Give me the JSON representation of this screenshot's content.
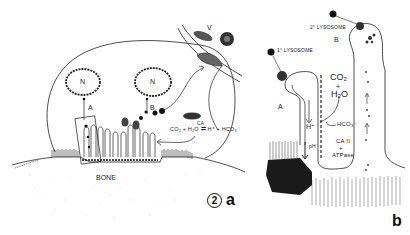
{
  "figure": {
    "number": "2",
    "panels": [
      {
        "id": "a",
        "label": "a",
        "labels": {
          "nucleus_left": "N",
          "nucleus_right": "N",
          "pathway_a": "A",
          "pathway_b": "B",
          "vessel": "V",
          "bone": "BONE",
          "equation": "CO₂ + H₂O ⇌ H⁺ + HCO₃⁻",
          "enzyme": "CA",
          "signature": "Baron"
        }
      },
      {
        "id": "b",
        "label": "b",
        "labels": {
          "primary_lysosome": "1° LYSOSOME",
          "secondary_lysosome": "2° LYSOSOME",
          "pathway_a": "A",
          "pathway_b": "B",
          "co2": "CO₂",
          "plus1": "+",
          "h2o": "H₂O",
          "hplus": "H⁺",
          "hco3": "HCO₃⁻",
          "ph": "pH",
          "ca2": "CA II",
          "plus2": "+",
          "atpase": "ATPase"
        }
      }
    ]
  },
  "colors": {
    "ink": "#222222",
    "background": "#ffffff",
    "bone_dots": "#d8d8d8"
  }
}
